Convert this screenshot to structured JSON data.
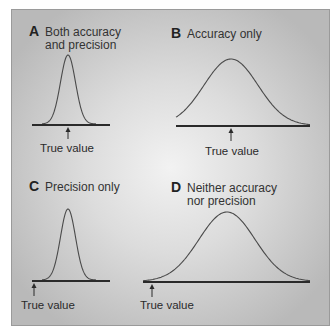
{
  "panels": [
    {
      "letter": "A",
      "title_lines": [
        "Both accuracy",
        "and precision"
      ],
      "distribution": "narrow",
      "true_value_position": "centered under peak",
      "true_value_label": "True value"
    },
    {
      "letter": "B",
      "title_lines": [
        "Accuracy only"
      ],
      "distribution": "wide",
      "true_value_position": "centered under peak",
      "true_value_label": "True value"
    },
    {
      "letter": "C",
      "title_lines": [
        "Precision only"
      ],
      "distribution": "narrow",
      "true_value_position": "left of distribution",
      "true_value_label": "True value"
    },
    {
      "letter": "D",
      "title_lines": [
        "Neither accuracy",
        "nor precision"
      ],
      "distribution": "wide",
      "true_value_position": "left of distribution",
      "true_value_label": "True value"
    }
  ]
}
